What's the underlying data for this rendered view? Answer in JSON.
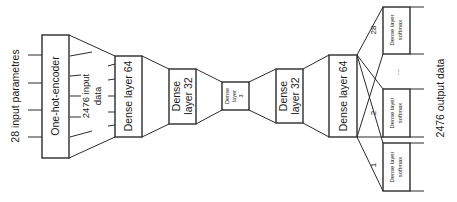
{
  "diagram": {
    "type": "autoencoder-architecture",
    "input_label": "28 input parametres",
    "encoder": {
      "label": "One-hot-encoder"
    },
    "encoded_label_line1": "2476 input",
    "encoded_label_line2": "data",
    "layers": [
      {
        "id": "enc-dense-64",
        "line1": "Dense layer 64",
        "line2": ""
      },
      {
        "id": "enc-dense-32",
        "line1": "Dense",
        "line2": "layer 32"
      },
      {
        "id": "bottleneck-3",
        "line1": "Dense",
        "line2": "layer",
        "line3": "3"
      },
      {
        "id": "dec-dense-32",
        "line1": "Dense",
        "line2": "layer 32"
      },
      {
        "id": "dec-dense-64",
        "line1": "Dense layer 64",
        "line2": ""
      }
    ],
    "softmax_heads": [
      {
        "index_label": "28",
        "line1": "Dense layer",
        "line2": "softmax"
      },
      {
        "index_label": "2",
        "line1": "Dense layer",
        "line2": "softmax"
      },
      {
        "index_label": "1",
        "line1": "Dense layer",
        "line2": "softmax"
      }
    ],
    "ellipsis": "...",
    "output_label": "2476 output data",
    "colors": {
      "stroke": "#2b2b2b",
      "text": "#1a1a1a",
      "background": "#ffffff"
    }
  }
}
